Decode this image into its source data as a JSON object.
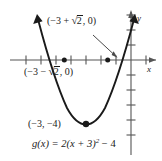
{
  "figure": {
    "axes": {
      "x_axis_label": "x",
      "y_axis_label": "y",
      "origin_px": [
        131,
        60
      ],
      "x_tick_spacing_px": 15,
      "y_tick_spacing_px": 15
    },
    "labels": {
      "intercept_right_prefix": "(−3 + ",
      "intercept_right_radicand": "2",
      "intercept_right_suffix": ", 0)",
      "intercept_left_prefix": "(−3 − ",
      "intercept_left_radicand": "2",
      "intercept_left_suffix": ", 0)",
      "vertex_label": "(−3, −4)",
      "equation_lhs": "g(x) = 2(x + 3)",
      "equation_exponent": "2",
      "equation_rhs": " − 4",
      "radical_sign": "√"
    },
    "curve": {
      "type": "parabola",
      "equation": "g(x) = 2(x + 3)^2 - 4",
      "vertex": [
        -3,
        -4
      ],
      "a": 2,
      "h": -3,
      "k": -4,
      "x_intercepts": [
        "-3 - sqrt(2)",
        "-3 + sqrt(2)"
      ],
      "x_intercept_values": [
        -4.414,
        -1.586
      ],
      "opens": "up",
      "arrowheads": "both-ends"
    },
    "points": [
      {
        "name": "vertex",
        "x": -3,
        "y": -4,
        "marker": "filled-dot"
      },
      {
        "name": "x-intercept-left",
        "x": -4.414,
        "y": 0,
        "marker": "filled-dot"
      },
      {
        "name": "x-intercept-right",
        "x": -1.586,
        "y": 0,
        "marker": "filled-dot"
      }
    ],
    "annotation_arrow": {
      "from": [
        95,
        36
      ],
      "to": [
        117,
        57
      ]
    },
    "colors": {
      "ink": "#1a1a1a",
      "axis": "#555555",
      "background": "#ffffff"
    }
  }
}
